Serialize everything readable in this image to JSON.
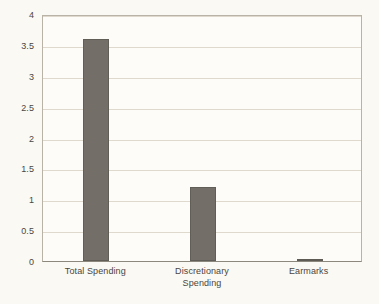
{
  "chart_data": {
    "type": "bar",
    "title": "",
    "subtitle": "",
    "xlabel": "",
    "ylabel": "",
    "categories": [
      "Total Spending",
      "Discretionary\nSpending",
      "Earmarks"
    ],
    "values": [
      3.6,
      1.2,
      0.02
    ],
    "series": [
      {
        "name": "",
        "values": [
          3.6,
          1.2,
          0.02
        ]
      }
    ],
    "ylim": [
      0,
      4
    ],
    "xlim": [
      0,
      3
    ],
    "y_ticks": [
      0,
      0.5,
      1,
      1.5,
      2,
      2.5,
      3,
      3.5,
      4
    ],
    "y_tick_labels": [
      "0",
      "0.5",
      "1",
      "1.5",
      "2",
      "2.5",
      "3",
      "3.5",
      "4"
    ],
    "grid": true,
    "grid_axis": "y",
    "legend": false,
    "legend_position": "none",
    "annotations": [],
    "colors": {
      "bar_fill": "#736f68",
      "bar_edge": "#615e58",
      "gridline": "#ded9cc",
      "axis_line": "#8c887e",
      "frame": "#b8b3a6",
      "text": "#4a4640",
      "plot_background": "#fdfcf8",
      "figure_background": "#faf9f4"
    }
  }
}
